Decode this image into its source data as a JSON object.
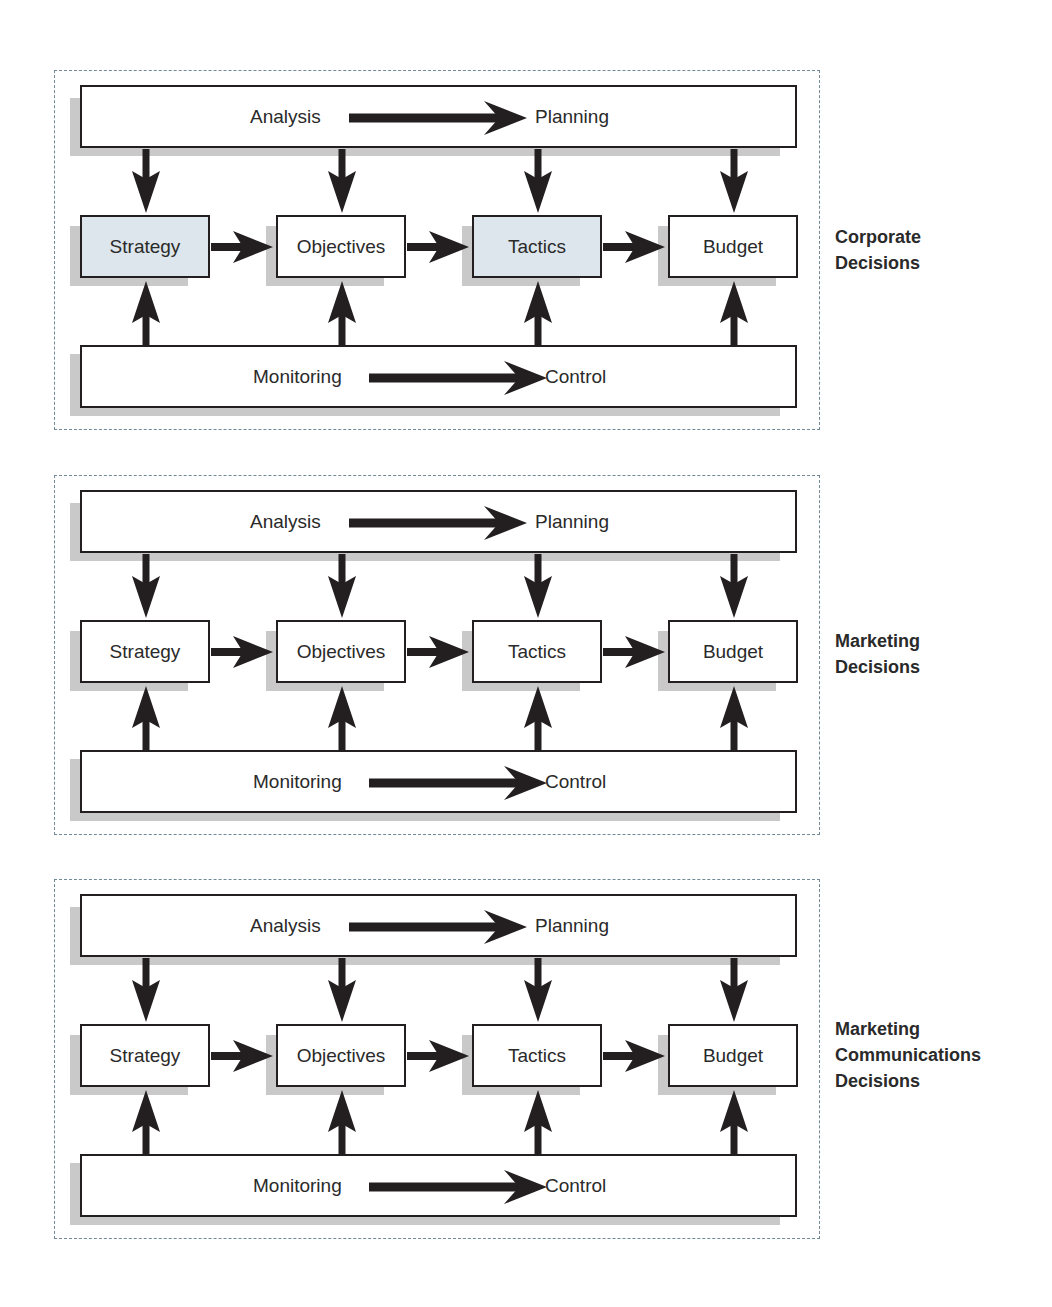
{
  "diagram": {
    "type": "flow",
    "colors": {
      "highlight_fill": "#dde6ec",
      "stroke": "#231f20",
      "dashed_border": "#6f8a96",
      "shadow": "#c9c9c9"
    },
    "panels": [
      {
        "title": "Corporate Decisions",
        "title_lines": [
          "Corporate",
          "Decisions"
        ],
        "top_bar": {
          "from": "Analysis",
          "to": "Planning"
        },
        "boxes": [
          {
            "label": "Strategy",
            "highlighted": true
          },
          {
            "label": "Objectives",
            "highlighted": false
          },
          {
            "label": "Tactics",
            "highlighted": true
          },
          {
            "label": "Budget",
            "highlighted": false
          }
        ],
        "bottom_bar": {
          "from": "Monitoring",
          "to": "Control"
        }
      },
      {
        "title": "Marketing Decisions",
        "title_lines": [
          "Marketing",
          "Decisions"
        ],
        "top_bar": {
          "from": "Analysis",
          "to": "Planning"
        },
        "boxes": [
          {
            "label": "Strategy",
            "highlighted": false
          },
          {
            "label": "Objectives",
            "highlighted": false
          },
          {
            "label": "Tactics",
            "highlighted": false
          },
          {
            "label": "Budget",
            "highlighted": false
          }
        ],
        "bottom_bar": {
          "from": "Monitoring",
          "to": "Control"
        }
      },
      {
        "title": "Marketing Communications Decisions",
        "title_lines": [
          "Marketing",
          "Communications",
          "Decisions"
        ],
        "top_bar": {
          "from": "Analysis",
          "to": "Planning"
        },
        "boxes": [
          {
            "label": "Strategy",
            "highlighted": false
          },
          {
            "label": "Objectives",
            "highlighted": false
          },
          {
            "label": "Tactics",
            "highlighted": false
          },
          {
            "label": "Budget",
            "highlighted": false
          }
        ],
        "bottom_bar": {
          "from": "Monitoring",
          "to": "Control"
        }
      }
    ],
    "edges": [
      "Analysis/Planning -> Strategy",
      "Analysis/Planning -> Objectives",
      "Analysis/Planning -> Tactics",
      "Analysis/Planning -> Budget",
      "Strategy -> Objectives",
      "Objectives -> Tactics",
      "Tactics -> Budget",
      "Monitoring/Control -> Strategy",
      "Monitoring/Control -> Objectives",
      "Monitoring/Control -> Tactics",
      "Monitoring/Control -> Budget",
      "Analysis -> Planning",
      "Monitoring -> Control"
    ]
  }
}
